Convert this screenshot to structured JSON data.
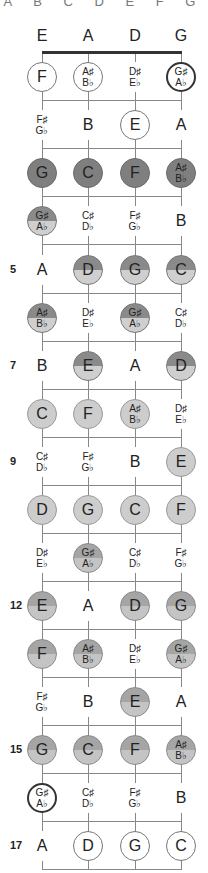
{
  "title": "A B C D E F G",
  "layout": {
    "string_x": [
      42,
      88,
      135,
      181
    ],
    "open_y": 36,
    "nut_y": 52,
    "row_y": [
      77,
      125,
      173,
      221,
      270,
      318,
      366,
      414,
      462,
      510,
      558,
      606,
      654,
      702,
      750,
      798,
      846
    ],
    "fret_line_y": [
      100,
      148,
      196,
      244,
      293,
      341,
      389,
      437,
      485,
      533,
      581,
      629,
      677,
      725,
      773,
      821,
      869
    ]
  },
  "colors": {
    "dark": "#7f7f7f",
    "split_top": "#8a8a8a",
    "split_bottom": "#cfcfcf",
    "light": "#cdcdcd",
    "line": "#888888",
    "nut": "#333333"
  },
  "open_strings": [
    {
      "label": "E",
      "style": "circled"
    },
    {
      "label": "A",
      "style": "plain"
    },
    {
      "label": "D",
      "style": "circled"
    },
    {
      "label": "G",
      "style": "circled"
    }
  ],
  "fret_numbers": [
    {
      "fret": 5,
      "label": "5"
    },
    {
      "fret": 7,
      "label": "7"
    },
    {
      "fret": 9,
      "label": "9"
    },
    {
      "fret": 12,
      "label": "12"
    },
    {
      "fret": 15,
      "label": "15"
    },
    {
      "fret": 17,
      "label": "17"
    }
  ],
  "frets": [
    [
      {
        "n": "F",
        "s": "circled"
      },
      {
        "n": "A♯",
        "f": "B♭",
        "s": "circled"
      },
      {
        "n": "D♯",
        "f": "E♭",
        "s": "plain"
      },
      {
        "n": "G♯",
        "f": "A♭",
        "s": "circled bold"
      }
    ],
    [
      {
        "n": "F♯",
        "f": "G♭",
        "s": "plain"
      },
      {
        "n": "B",
        "s": "plain"
      },
      {
        "n": "E",
        "s": "circled"
      },
      {
        "n": "A",
        "s": "plain"
      }
    ],
    [
      {
        "n": "G",
        "s": "dark"
      },
      {
        "n": "C",
        "s": "dark"
      },
      {
        "n": "F",
        "s": "dark"
      },
      {
        "n": "A♯",
        "f": "B♭",
        "s": "dark"
      }
    ],
    [
      {
        "n": "G♯",
        "f": "A♭",
        "s": "split bold"
      },
      {
        "n": "C♯",
        "f": "D♭",
        "s": "plain"
      },
      {
        "n": "F♯",
        "f": "G♭",
        "s": "plain"
      },
      {
        "n": "B",
        "s": "plain"
      }
    ],
    [
      {
        "n": "A",
        "s": "plain"
      },
      {
        "n": "D",
        "s": "split"
      },
      {
        "n": "G",
        "s": "split"
      },
      {
        "n": "C",
        "s": "split"
      }
    ],
    [
      {
        "n": "A♯",
        "f": "B♭",
        "s": "split"
      },
      {
        "n": "D♯",
        "f": "E♭",
        "s": "plain"
      },
      {
        "n": "G♯",
        "f": "A♭",
        "s": "split bold"
      },
      {
        "n": "C♯",
        "f": "D♭",
        "s": "plain"
      }
    ],
    [
      {
        "n": "B",
        "s": "plain"
      },
      {
        "n": "E",
        "s": "split"
      },
      {
        "n": "A",
        "s": "plain"
      },
      {
        "n": "D",
        "s": "split"
      }
    ],
    [
      {
        "n": "C",
        "s": "light"
      },
      {
        "n": "F",
        "s": "light"
      },
      {
        "n": "A♯",
        "f": "B♭",
        "s": "light"
      },
      {
        "n": "D♯",
        "f": "E♭",
        "s": "plain"
      }
    ],
    [
      {
        "n": "C♯",
        "f": "D♭",
        "s": "plain"
      },
      {
        "n": "F♯",
        "f": "G♭",
        "s": "plain"
      },
      {
        "n": "B",
        "s": "plain"
      },
      {
        "n": "E",
        "s": "light"
      }
    ],
    [
      {
        "n": "D",
        "s": "light"
      },
      {
        "n": "G",
        "s": "light"
      },
      {
        "n": "C",
        "s": "light"
      },
      {
        "n": "F",
        "s": "light"
      }
    ],
    [
      {
        "n": "D♯",
        "f": "E♭",
        "s": "plain"
      },
      {
        "n": "G♯",
        "f": "A♭",
        "s": "mid bold"
      },
      {
        "n": "C♯",
        "f": "D♭",
        "s": "plain"
      },
      {
        "n": "F♯",
        "f": "G♭",
        "s": "plain"
      }
    ],
    [
      {
        "n": "E",
        "s": "mid"
      },
      {
        "n": "A",
        "s": "plain"
      },
      {
        "n": "D",
        "s": "mid"
      },
      {
        "n": "G",
        "s": "mid"
      }
    ],
    [
      {
        "n": "F",
        "s": "mid"
      },
      {
        "n": "A♯",
        "f": "B♭",
        "s": "mid"
      },
      {
        "n": "D♯",
        "f": "E♭",
        "s": "plain"
      },
      {
        "n": "G♯",
        "f": "A♭",
        "s": "mid bold"
      }
    ],
    [
      {
        "n": "F♯",
        "f": "G♭",
        "s": "plain"
      },
      {
        "n": "B",
        "s": "plain"
      },
      {
        "n": "E",
        "s": "mid"
      },
      {
        "n": "A",
        "s": "plain"
      }
    ],
    [
      {
        "n": "G",
        "s": "mid"
      },
      {
        "n": "C",
        "s": "mid"
      },
      {
        "n": "F",
        "s": "mid"
      },
      {
        "n": "A♯",
        "f": "B♭",
        "s": "mid"
      }
    ],
    [
      {
        "n": "G♯",
        "f": "A♭",
        "s": "circled bold"
      },
      {
        "n": "C♯",
        "f": "D♭",
        "s": "plain"
      },
      {
        "n": "F♯",
        "f": "G♭",
        "s": "plain"
      },
      {
        "n": "B",
        "s": "plain"
      }
    ],
    [
      {
        "n": "A",
        "s": "plain"
      },
      {
        "n": "D",
        "s": "circled"
      },
      {
        "n": "G",
        "s": "circled"
      },
      {
        "n": "C",
        "s": "circled"
      }
    ]
  ]
}
